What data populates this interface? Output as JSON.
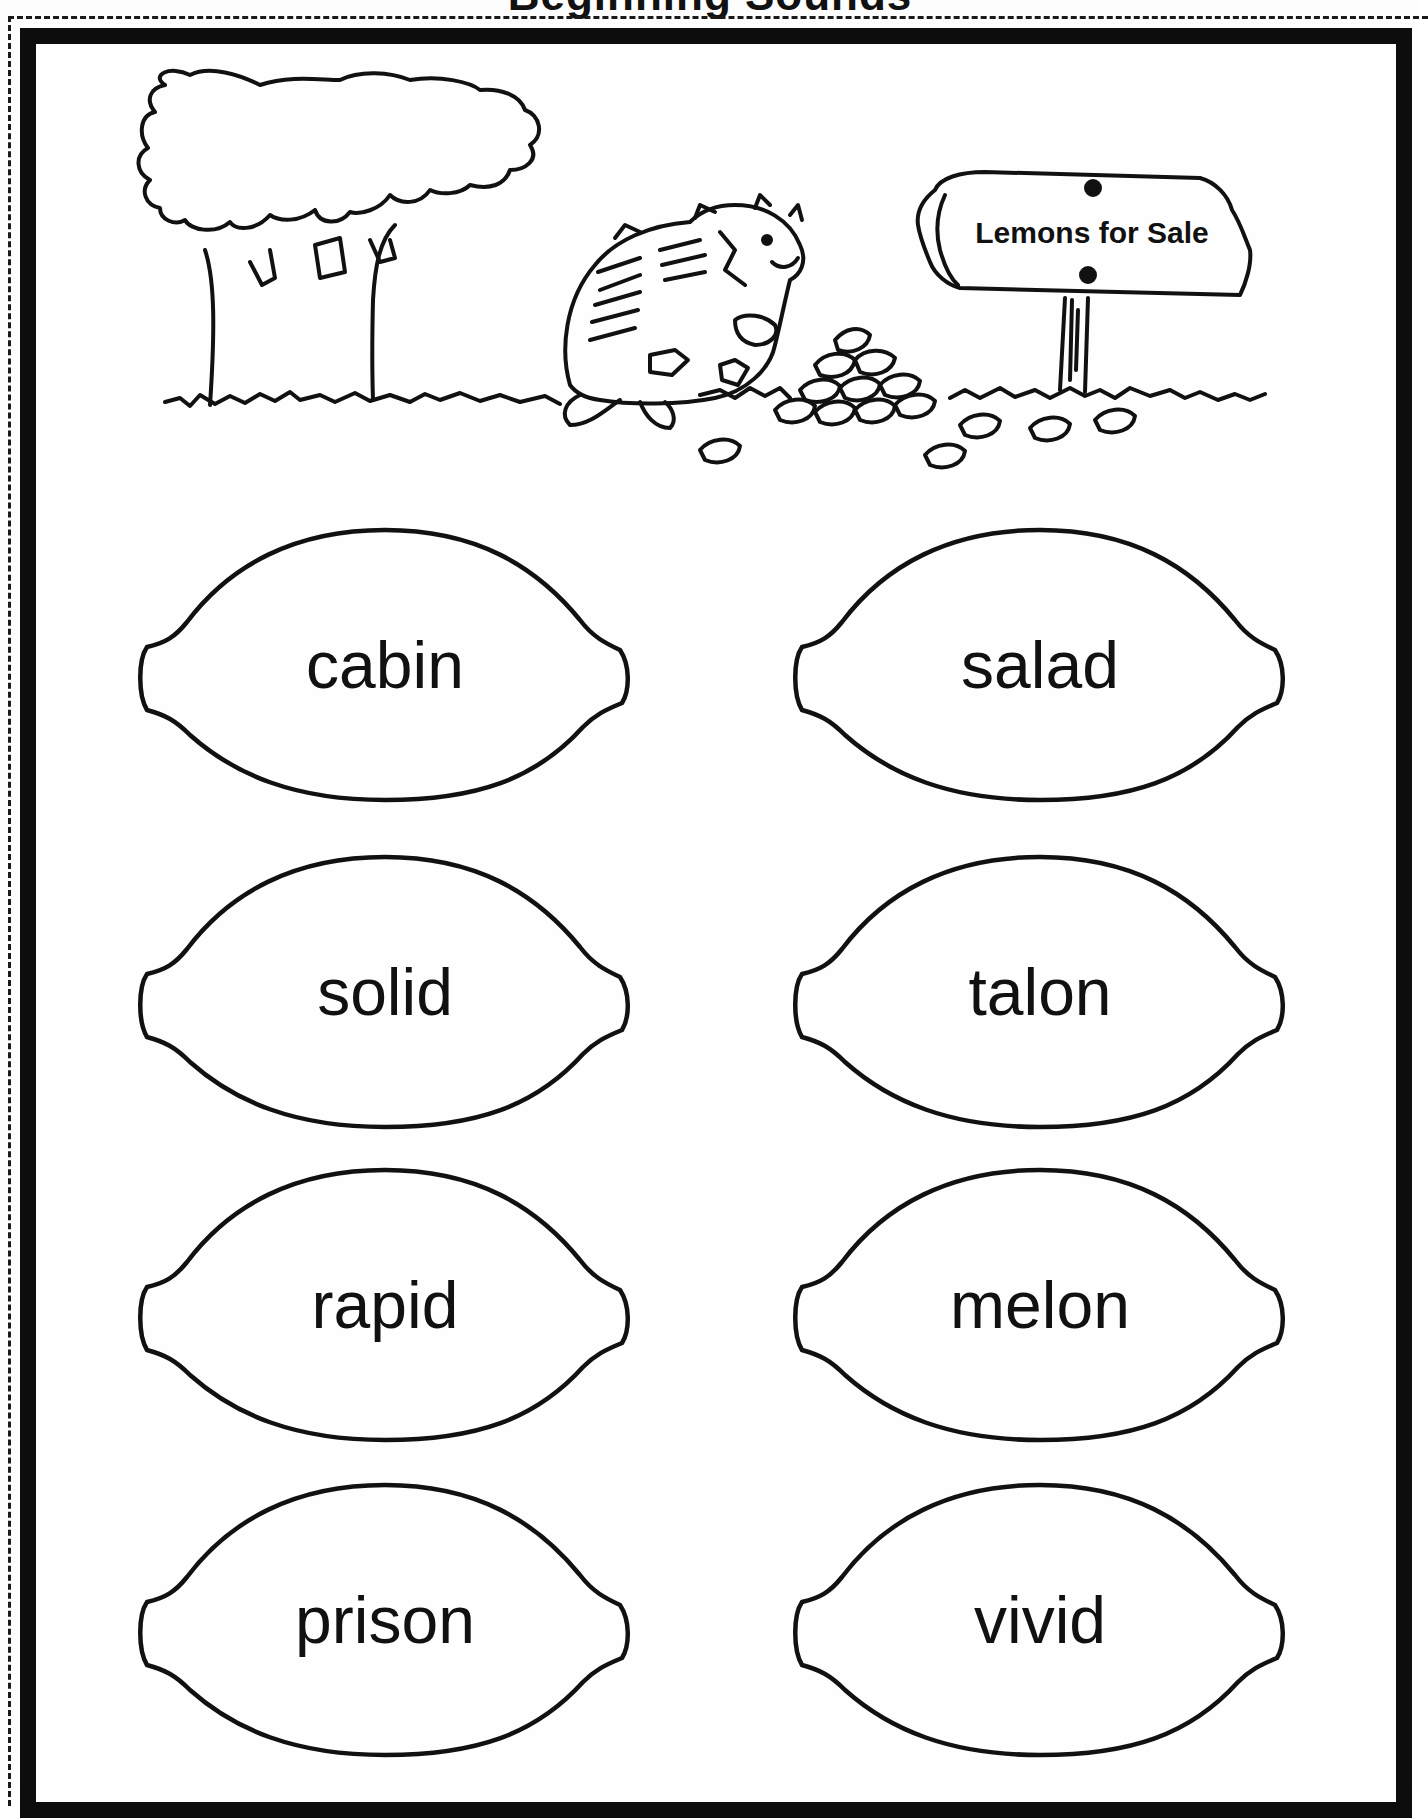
{
  "worksheet": {
    "title_partial": "Beginning Sounds",
    "scene": {
      "sign_text": "Lemons for Sale"
    },
    "lemons": [
      {
        "word": "cabin",
        "column": "left",
        "row": 1
      },
      {
        "word": "salad",
        "column": "right",
        "row": 1
      },
      {
        "word": "solid",
        "column": "left",
        "row": 2
      },
      {
        "word": "talon",
        "column": "right",
        "row": 2
      },
      {
        "word": "rapid",
        "column": "left",
        "row": 3
      },
      {
        "word": "melon",
        "column": "right",
        "row": 3
      },
      {
        "word": "prison",
        "column": "left",
        "row": 4
      },
      {
        "word": "vivid",
        "column": "right",
        "row": 4
      }
    ]
  },
  "colors": {
    "ink": "#111111",
    "paper": "#fefefe",
    "frame": "#0d0d0d"
  }
}
